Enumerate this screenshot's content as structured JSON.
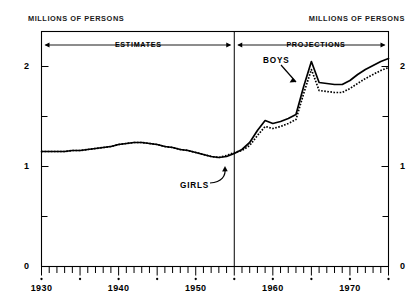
{
  "axis_units": {
    "left_label": "MILLIONS OF PERSONS",
    "right_label": "MILLIONS OF PERSONS"
  },
  "bands": [
    {
      "name": "estimates",
      "label": "ESTIMATES",
      "from": 1930,
      "to": 1955
    },
    {
      "name": "projections",
      "label": "PROJECTIONS",
      "from": 1955,
      "to": 1975
    }
  ],
  "annotations": [
    {
      "name": "boys",
      "label": "BOYS"
    },
    {
      "name": "girls",
      "label": "GIRLS"
    }
  ],
  "chart_data": {
    "type": "line",
    "title": "",
    "subtitle": "",
    "xlabel": "",
    "ylabel": "MILLIONS OF PERSONS",
    "xlim": [
      1930,
      1975
    ],
    "ylim": [
      0,
      2.35
    ],
    "grid": false,
    "legend_position": "inline-annotations",
    "divider_year": 1955,
    "divider_note": "ESTIMATES left of 1955, PROJECTIONS right of 1955",
    "ytick_labels": [
      "0",
      "1",
      "2"
    ],
    "yticks_major": [
      0,
      1,
      2
    ],
    "yticks_minor": [
      0.5,
      1.5
    ],
    "xtick_labels": [
      "1930",
      "1940",
      "1950",
      "1960",
      "1970"
    ],
    "xticks_major": [
      1930,
      1940,
      1950,
      1960,
      1970
    ],
    "xticks_minor_step": 1,
    "xticks_dot_step": 5,
    "x": [
      1930,
      1931,
      1932,
      1933,
      1934,
      1935,
      1936,
      1937,
      1938,
      1939,
      1940,
      1941,
      1942,
      1943,
      1944,
      1945,
      1946,
      1947,
      1948,
      1949,
      1950,
      1951,
      1952,
      1953,
      1954,
      1955,
      1956,
      1957,
      1958,
      1959,
      1960,
      1961,
      1962,
      1963,
      1964,
      1965,
      1966,
      1967,
      1968,
      1969,
      1970,
      1971,
      1972,
      1973,
      1974,
      1975
    ],
    "series": [
      {
        "name": "BOYS",
        "style": "solid",
        "values": [
          1.15,
          1.15,
          1.15,
          1.15,
          1.16,
          1.16,
          1.17,
          1.18,
          1.19,
          1.2,
          1.22,
          1.23,
          1.24,
          1.24,
          1.23,
          1.22,
          1.2,
          1.19,
          1.17,
          1.16,
          1.14,
          1.12,
          1.1,
          1.09,
          1.1,
          1.13,
          1.17,
          1.24,
          1.36,
          1.46,
          1.43,
          1.45,
          1.48,
          1.52,
          1.8,
          2.05,
          1.84,
          1.83,
          1.82,
          1.82,
          1.86,
          1.92,
          1.97,
          2.01,
          2.05,
          2.08
        ]
      },
      {
        "name": "GIRLS",
        "style": "dotted",
        "values": [
          1.15,
          1.15,
          1.15,
          1.15,
          1.16,
          1.16,
          1.17,
          1.18,
          1.19,
          1.2,
          1.22,
          1.23,
          1.24,
          1.24,
          1.23,
          1.22,
          1.2,
          1.19,
          1.17,
          1.16,
          1.14,
          1.12,
          1.1,
          1.09,
          1.11,
          1.14,
          1.16,
          1.21,
          1.31,
          1.4,
          1.38,
          1.4,
          1.43,
          1.47,
          1.73,
          1.97,
          1.76,
          1.75,
          1.74,
          1.74,
          1.78,
          1.83,
          1.88,
          1.92,
          1.96,
          1.99
        ]
      }
    ]
  }
}
